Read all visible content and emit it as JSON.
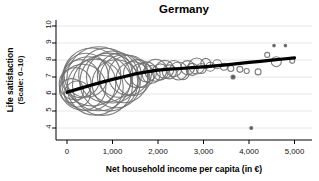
{
  "chart_data": {
    "type": "scatter",
    "subtype": "bubble-scatter-with-lowess-trend",
    "title": "Germany",
    "xlabel": "Net household income per capita (in €)",
    "ylabel_line1": "Life satisfaction",
    "ylabel_line2": "(Scale: 0–10)",
    "xlim": [
      0,
      5000
    ],
    "ylim": [
      4,
      10
    ],
    "grid": "horizontal-light-gray",
    "legend": "none",
    "xticks": [
      {
        "v": 0,
        "label": "0"
      },
      {
        "v": 1000,
        "label": "1,000"
      },
      {
        "v": 2000,
        "label": "2,000"
      },
      {
        "v": 3000,
        "label": "3,000"
      },
      {
        "v": 4000,
        "label": "4,000"
      },
      {
        "v": 5000,
        "label": "5,000"
      }
    ],
    "yticks": [
      {
        "v": 4,
        "label": "4"
      },
      {
        "v": 5,
        "label": "5"
      },
      {
        "v": 6,
        "label": "6"
      },
      {
        "v": 7,
        "label": "7"
      },
      {
        "v": 8,
        "label": "8"
      },
      {
        "v": 9,
        "label": "9"
      },
      {
        "v": 10,
        "label": "10"
      }
    ],
    "colors": {
      "bubble_stroke": "#6f6f6f",
      "dot_fill": "#5a5a5a",
      "trend": "#000000",
      "grid": "#e3e3e3",
      "axis": "#000000",
      "background": "#ffffff"
    },
    "bubbles": [
      {
        "x": 100,
        "y": 6.2,
        "r": 12
      },
      {
        "x": 180,
        "y": 6.6,
        "r": 16
      },
      {
        "x": 230,
        "y": 6.0,
        "r": 13
      },
      {
        "x": 300,
        "y": 6.9,
        "r": 19
      },
      {
        "x": 350,
        "y": 6.4,
        "r": 23
      },
      {
        "x": 420,
        "y": 7.1,
        "r": 22
      },
      {
        "x": 480,
        "y": 6.6,
        "r": 27
      },
      {
        "x": 550,
        "y": 7.0,
        "r": 29
      },
      {
        "x": 620,
        "y": 6.4,
        "r": 28
      },
      {
        "x": 700,
        "y": 6.9,
        "r": 32
      },
      {
        "x": 780,
        "y": 6.5,
        "r": 30
      },
      {
        "x": 850,
        "y": 7.1,
        "r": 27
      },
      {
        "x": 920,
        "y": 6.7,
        "r": 29
      },
      {
        "x": 1000,
        "y": 7.0,
        "r": 26
      },
      {
        "x": 1080,
        "y": 6.6,
        "r": 24
      },
      {
        "x": 1150,
        "y": 7.1,
        "r": 22
      },
      {
        "x": 1250,
        "y": 6.9,
        "r": 24
      },
      {
        "x": 1350,
        "y": 7.1,
        "r": 20
      },
      {
        "x": 1450,
        "y": 6.9,
        "r": 17
      },
      {
        "x": 1550,
        "y": 7.2,
        "r": 14
      },
      {
        "x": 1650,
        "y": 7.1,
        "r": 12
      },
      {
        "x": 1750,
        "y": 7.3,
        "r": 10
      },
      {
        "x": 1850,
        "y": 7.15,
        "r": 9
      },
      {
        "x": 1950,
        "y": 7.4,
        "r": 11
      },
      {
        "x": 2050,
        "y": 7.3,
        "r": 8
      },
      {
        "x": 2150,
        "y": 7.45,
        "r": 9
      },
      {
        "x": 2250,
        "y": 7.3,
        "r": 7
      },
      {
        "x": 2350,
        "y": 7.5,
        "r": 8
      },
      {
        "x": 2450,
        "y": 7.35,
        "r": 9
      },
      {
        "x": 2550,
        "y": 7.2,
        "r": 6
      },
      {
        "x": 2650,
        "y": 7.55,
        "r": 7
      },
      {
        "x": 2750,
        "y": 7.45,
        "r": 6
      },
      {
        "x": 2850,
        "y": 7.65,
        "r": 8
      },
      {
        "x": 2950,
        "y": 7.5,
        "r": 5
      },
      {
        "x": 3050,
        "y": 7.8,
        "r": 5
      },
      {
        "x": 3150,
        "y": 7.6,
        "r": 4.5
      },
      {
        "x": 3300,
        "y": 7.75,
        "r": 4.5
      },
      {
        "x": 3450,
        "y": 7.6,
        "r": 3.5
      },
      {
        "x": 3600,
        "y": 7.5,
        "r": 3
      },
      {
        "x": 3650,
        "y": 7.0,
        "r": 2,
        "filled": true
      },
      {
        "x": 3800,
        "y": 7.45,
        "r": 3
      },
      {
        "x": 3950,
        "y": 7.35,
        "r": 2.5
      },
      {
        "x": 4050,
        "y": 4.0,
        "r": 1.5,
        "filled": true
      },
      {
        "x": 4200,
        "y": 7.3,
        "r": 3
      },
      {
        "x": 4400,
        "y": 8.3,
        "r": 2.5
      },
      {
        "x": 4550,
        "y": 8.85,
        "r": 1.3,
        "filled": true
      },
      {
        "x": 4600,
        "y": 7.9,
        "r": 5
      },
      {
        "x": 4800,
        "y": 8.85,
        "r": 1.3,
        "filled": true
      },
      {
        "x": 4950,
        "y": 7.95,
        "r": 2.5
      }
    ],
    "trend": [
      [
        0,
        6.1
      ],
      [
        250,
        6.3
      ],
      [
        500,
        6.5
      ],
      [
        750,
        6.68
      ],
      [
        1000,
        6.86
      ],
      [
        1250,
        7.02
      ],
      [
        1500,
        7.18
      ],
      [
        1750,
        7.3
      ],
      [
        2000,
        7.4
      ],
      [
        2250,
        7.46
      ],
      [
        2500,
        7.5
      ],
      [
        2750,
        7.55
      ],
      [
        3000,
        7.6
      ],
      [
        3250,
        7.66
      ],
      [
        3500,
        7.72
      ],
      [
        3750,
        7.79
      ],
      [
        4000,
        7.86
      ],
      [
        4250,
        7.92
      ],
      [
        4500,
        7.99
      ],
      [
        4750,
        8.06
      ],
      [
        5000,
        8.13
      ]
    ],
    "geom_hint": {
      "x0_px": 67,
      "px_per_unit_x": 0.0455,
      "ytop_val": 10,
      "ytop_px": 26,
      "px_per_unit_y": 17,
      "plot_left_px": 56,
      "plot_right_px": 312,
      "plot_top_px": 20,
      "plot_bottom_px": 140
    }
  }
}
